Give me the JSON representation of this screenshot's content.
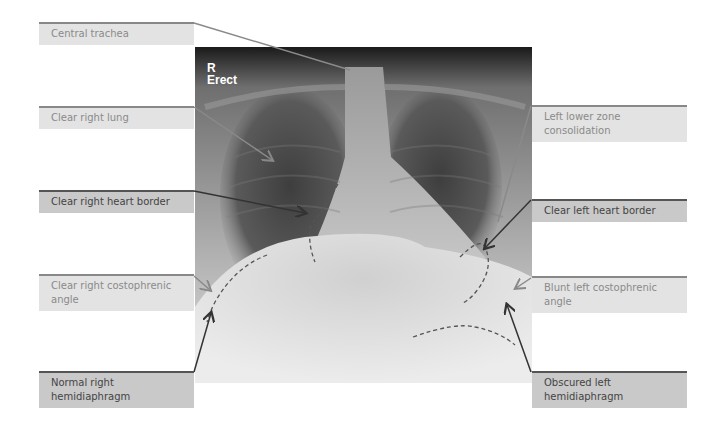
{
  "figure": {
    "image_markers": {
      "side": "R",
      "position": "Erect"
    },
    "labels_left": [
      {
        "id": "central-trachea",
        "text": "Central trachea",
        "style": "light"
      },
      {
        "id": "clear-right-lung",
        "text": "Clear right lung",
        "style": "light"
      },
      {
        "id": "clear-right-heart-border",
        "text": "Clear right heart border",
        "style": "dark"
      },
      {
        "id": "clear-right-costophrenic-angle",
        "text": "Clear right costophrenic angle",
        "style": "light"
      },
      {
        "id": "normal-right-hemidiaphragm",
        "text": "Normal right hemidiaphragm",
        "style": "dark"
      }
    ],
    "labels_right": [
      {
        "id": "left-lower-zone-consolidation",
        "text": "Left lower zone consolidation",
        "style": "light"
      },
      {
        "id": "clear-left-heart-border",
        "text": "Clear left heart border",
        "style": "dark"
      },
      {
        "id": "blunt-left-costophrenic-angle",
        "text": "Blunt left costophrenic angle",
        "style": "light"
      },
      {
        "id": "obscured-left-hemidiaphragm",
        "text": "Obscured left hemidiaphragm",
        "style": "dark"
      }
    ],
    "colors": {
      "light_box": "#e3e3e3",
      "dark_box": "#c9c9c9",
      "light_line": "#888888",
      "dark_line": "#555555",
      "dashed_outline": "#555555"
    }
  }
}
